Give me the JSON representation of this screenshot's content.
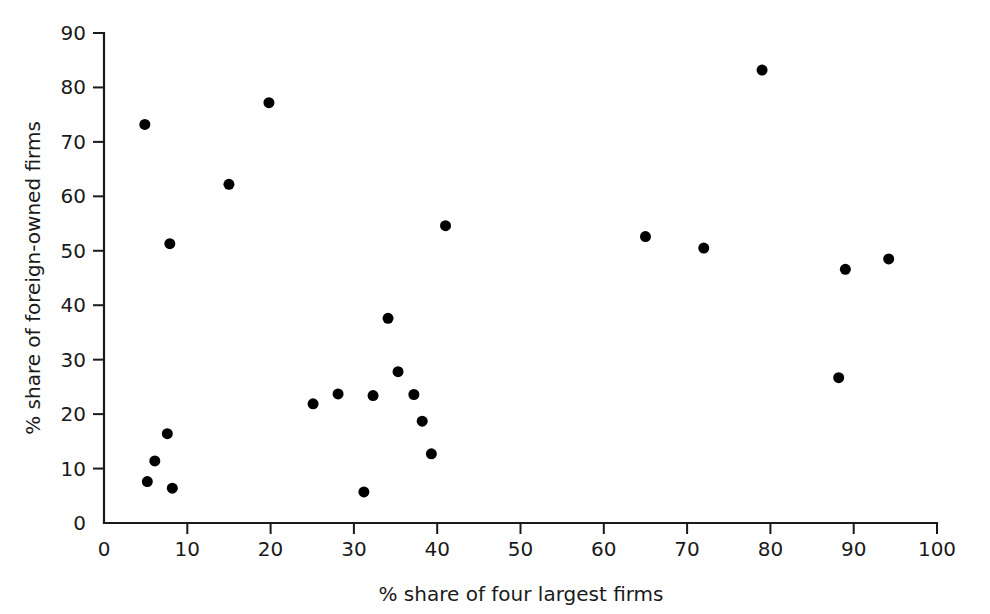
{
  "chart_data": {
    "type": "scatter",
    "title": "",
    "xlabel": "% share of four largest firms",
    "ylabel": "% share of foreign-owned firms",
    "xlim": [
      0,
      100
    ],
    "ylim": [
      0,
      90
    ],
    "grid": false,
    "legend": null,
    "xticks": [
      "0",
      "10",
      "20",
      "30",
      "40",
      "50",
      "60",
      "70",
      "80",
      "90",
      "100"
    ],
    "xtick_values": [
      0,
      10,
      20,
      30,
      40,
      50,
      60,
      70,
      80,
      90,
      100
    ],
    "yticks": [
      "0",
      "10",
      "20",
      "30",
      "40",
      "50",
      "60",
      "70",
      "80",
      "90"
    ],
    "ytick_values": [
      0,
      10,
      20,
      30,
      40,
      50,
      60,
      70,
      80,
      90
    ],
    "marker": "filled-circle",
    "marker_color": "#000000",
    "marker_size": 11,
    "points": [
      {
        "x": 4.9,
        "y": 73.2
      },
      {
        "x": 7.9,
        "y": 51.3
      },
      {
        "x": 15.0,
        "y": 62.2
      },
      {
        "x": 19.8,
        "y": 77.2
      },
      {
        "x": 5.2,
        "y": 7.6
      },
      {
        "x": 6.1,
        "y": 11.4
      },
      {
        "x": 7.6,
        "y": 16.4
      },
      {
        "x": 8.2,
        "y": 6.4
      },
      {
        "x": 25.1,
        "y": 21.9
      },
      {
        "x": 28.1,
        "y": 23.7
      },
      {
        "x": 31.2,
        "y": 5.7
      },
      {
        "x": 32.3,
        "y": 23.4
      },
      {
        "x": 34.1,
        "y": 37.6
      },
      {
        "x": 35.3,
        "y": 27.8
      },
      {
        "x": 37.2,
        "y": 23.6
      },
      {
        "x": 38.2,
        "y": 18.7
      },
      {
        "x": 39.3,
        "y": 12.7
      },
      {
        "x": 41.0,
        "y": 54.6
      },
      {
        "x": 65.0,
        "y": 52.6
      },
      {
        "x": 72.0,
        "y": 50.5
      },
      {
        "x": 79.0,
        "y": 83.2
      },
      {
        "x": 88.2,
        "y": 26.7
      },
      {
        "x": 89.0,
        "y": 46.6
      },
      {
        "x": 94.2,
        "y": 48.5
      }
    ]
  },
  "colors": {
    "axis": "#1a1a1a",
    "marker": "#000000",
    "background": "#ffffff"
  }
}
